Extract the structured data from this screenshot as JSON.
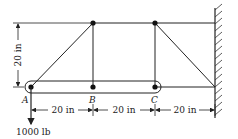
{
  "diagram": {
    "type": "truss-mechanics",
    "joints": [
      {
        "id": "A",
        "label": "A"
      },
      {
        "id": "B",
        "label": "B"
      },
      {
        "id": "C",
        "label": "C"
      }
    ],
    "dimensions": {
      "vertical": "20 in",
      "ab": "20 in",
      "bc": "20 in",
      "c_wall": "20 in"
    },
    "load": {
      "label": "1000 lb",
      "direction": "down",
      "at": "A"
    },
    "colors": {
      "line": "#222222",
      "background": "#ffffff"
    }
  }
}
